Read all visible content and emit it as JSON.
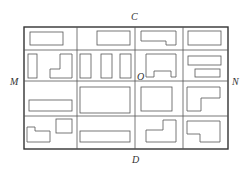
{
  "labels": {
    "top": "C",
    "bottom": "D",
    "left": "M",
    "right": "N",
    "center": "O"
  },
  "grid": {
    "columns": 4,
    "rows": 4,
    "stroke_color": "#444444"
  }
}
